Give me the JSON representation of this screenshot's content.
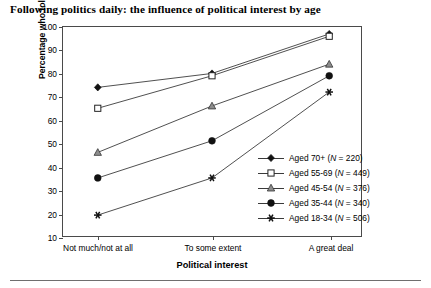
{
  "chart_data": {
    "type": "line",
    "title": "Following politics daily: the influence of political interest by age",
    "xlabel": "Political interest",
    "ylabel": "Percentage  who follow politics daily",
    "categories": [
      "Not much/not at all",
      "To some extent",
      "A great deal"
    ],
    "yticks": [
      10,
      20,
      30,
      40,
      50,
      60,
      70,
      80,
      90,
      100
    ],
    "ylim": [
      10,
      100
    ],
    "grid": false,
    "legend_position": "inside-lower-right",
    "series": [
      {
        "name": "Aged 70+ (N = 220)",
        "label_age": "Aged 70+",
        "n": 220,
        "marker": "filled-diamond",
        "values": [
          74,
          80,
          97
        ]
      },
      {
        "name": "Aged 55-69 (N = 449)",
        "label_age": "Aged 55-69",
        "n": 449,
        "marker": "open-square",
        "values": [
          65,
          79,
          96
        ]
      },
      {
        "name": "Aged 45-54 (N = 376)",
        "label_age": "Aged 45-54",
        "n": 376,
        "marker": "shaded-triangle",
        "values": [
          46,
          66,
          84
        ]
      },
      {
        "name": "Aged 35-44 (N = 340)",
        "label_age": "Aged 35-44",
        "n": 340,
        "marker": "filled-circle",
        "values": [
          35,
          51,
          79
        ]
      },
      {
        "name": "Aged 18-34 (N = 506)",
        "label_age": "Aged 18-34",
        "n": 506,
        "marker": "asterisk",
        "values": [
          19,
          35,
          72
        ]
      }
    ],
    "colors": {
      "line": "#3a3a3a",
      "axis": "#4a4a4a",
      "text": "#000000",
      "background": "#ffffff"
    }
  }
}
